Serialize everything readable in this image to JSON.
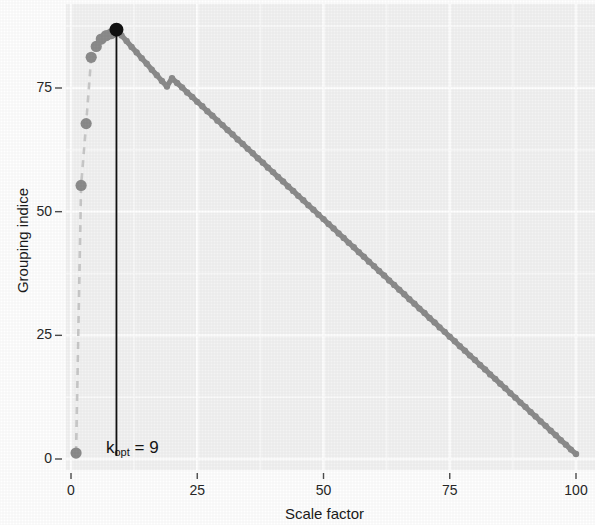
{
  "chart_data": {
    "type": "line",
    "title": "",
    "xlabel": "Scale factor",
    "ylabel": "Grouping indice",
    "xlim": [
      0,
      103
    ],
    "ylim": [
      -2,
      90
    ],
    "xticks": [
      0,
      25,
      50,
      75,
      100
    ],
    "xticklabels": [
      "0",
      "25",
      "50",
      "75",
      "100"
    ],
    "yticks": [
      0,
      25,
      50,
      75
    ],
    "yticklabels": [
      "0",
      "25",
      "50",
      "75"
    ],
    "grid": true,
    "grid_major_color": "#ffffff",
    "grid_minor_color": "#fbfbfb",
    "panel_background": "#f3f3f3",
    "legend": "none",
    "series": [
      {
        "name": "Grouping indice vs scale factor",
        "marker": "circle",
        "color": "#8c8c8c",
        "line_color": "#c9c9c9",
        "line_style_rise": "dashed",
        "line_style_fall": "solid",
        "x": [
          1,
          2,
          3,
          4,
          5,
          6,
          7,
          8,
          9,
          10,
          11,
          12,
          13,
          14,
          15,
          16,
          17,
          18,
          19,
          20,
          21,
          22,
          23,
          24,
          25,
          26,
          27,
          28,
          29,
          30,
          31,
          32,
          33,
          34,
          35,
          36,
          37,
          38,
          39,
          40,
          41,
          42,
          43,
          44,
          45,
          46,
          47,
          48,
          49,
          50,
          51,
          52,
          53,
          54,
          55,
          56,
          57,
          58,
          59,
          60,
          61,
          62,
          63,
          64,
          65,
          66,
          67,
          68,
          69,
          70,
          71,
          72,
          73,
          74,
          75,
          76,
          77,
          78,
          79,
          80,
          81,
          82,
          83,
          84,
          85,
          86,
          87,
          88,
          89,
          90,
          91,
          92,
          93,
          94,
          95,
          96,
          97,
          98,
          99,
          100
        ],
        "y": [
          1.2,
          55.3,
          67.8,
          81.2,
          83.4,
          84.9,
          85.6,
          86.0,
          86.8,
          85.6,
          84.5,
          83.3,
          82.2,
          81.0,
          79.9,
          78.7,
          77.6,
          76.4,
          75.3,
          77.0,
          76.0,
          75.1,
          74.1,
          73.2,
          72.2,
          71.3,
          70.3,
          69.4,
          68.4,
          67.5,
          66.5,
          65.6,
          64.6,
          63.7,
          62.7,
          61.8,
          60.8,
          59.9,
          58.9,
          58.0,
          57.0,
          56.1,
          55.1,
          54.2,
          53.2,
          52.3,
          51.3,
          50.4,
          49.4,
          48.5,
          47.5,
          46.6,
          45.6,
          44.7,
          43.7,
          42.8,
          41.8,
          40.9,
          39.9,
          39.0,
          38.0,
          37.1,
          36.1,
          35.2,
          34.2,
          33.3,
          32.3,
          31.4,
          30.4,
          29.5,
          28.5,
          27.6,
          26.6,
          25.7,
          24.7,
          23.8,
          22.8,
          21.9,
          20.9,
          20.0,
          19.0,
          18.1,
          17.1,
          16.2,
          15.2,
          14.3,
          13.3,
          12.4,
          11.4,
          10.5,
          9.5,
          8.6,
          7.6,
          6.7,
          5.7,
          4.8,
          3.8,
          2.9,
          1.9,
          1.0
        ]
      }
    ],
    "highlight_point": {
      "name": "optimal-scale-factor",
      "x": 9,
      "y": 86.8,
      "color": "#111111",
      "radius": 7
    },
    "annotations": [
      {
        "name": "k-opt-annotation",
        "text_base": "k",
        "text_sub": "opt",
        "text_tail": " = 9",
        "full_text": "kopt = 9",
        "x": 9,
        "line_color": "#111111",
        "line_from_y": 86.8,
        "line_to_y": 0
      }
    ]
  }
}
